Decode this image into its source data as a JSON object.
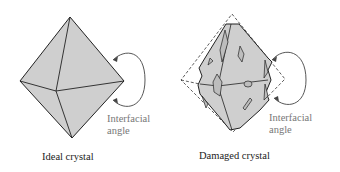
{
  "ideal": {
    "caption": "Ideal crystal",
    "angle_label_line1": "Interfacial",
    "angle_label_line2": "angle"
  },
  "damaged": {
    "caption": "Damaged crystal",
    "angle_label_line1": "Interfacial",
    "angle_label_line2": "angle"
  },
  "colors": {
    "crystal_fill": "#cfcfcf",
    "edge": "#222222",
    "angle_text": "#777777"
  }
}
